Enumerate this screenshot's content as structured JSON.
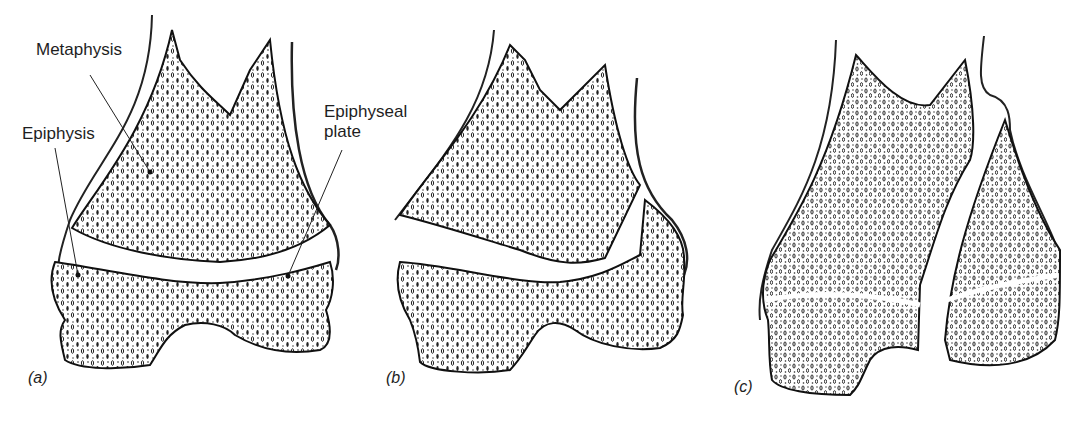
{
  "figure": {
    "panels": [
      {
        "id": "a",
        "tag": "(a)",
        "description": "Normal distal femur with intact epiphyseal plate"
      },
      {
        "id": "b",
        "tag": "(b)",
        "description": "Fracture separating metaphysis from epiphysis through the epiphyseal plate"
      },
      {
        "id": "c",
        "tag": "(c)",
        "description": "Vertical fracture through metaphysis, plate and epiphysis"
      }
    ],
    "labels": {
      "metaphysis": "Metaphysis",
      "epiphysis": "Epiphysis",
      "plate_line1": "Epiphyseal",
      "plate_line2": "plate"
    },
    "colors": {
      "ink": "#1e1e1e",
      "background": "#ffffff"
    }
  }
}
